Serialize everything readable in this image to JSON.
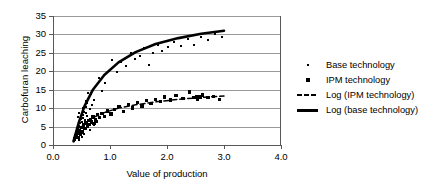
{
  "chart_data": {
    "type": "scatter",
    "title": "",
    "xlabel": "Value of production",
    "ylabel": "Carbofuran leaching",
    "xlim": [
      0.0,
      4.0
    ],
    "ylim": [
      0,
      35
    ],
    "xticks": [
      "0.0",
      "1.0",
      "2.0",
      "3.0",
      "4.0"
    ],
    "xtick_values": [
      0.0,
      1.0,
      2.0,
      3.0,
      4.0
    ],
    "yticks": [
      "0",
      "5",
      "10",
      "15",
      "20",
      "25",
      "30",
      "35"
    ],
    "ytick_values": [
      0,
      5,
      10,
      15,
      20,
      25,
      30,
      35
    ],
    "grid": true,
    "legend_position": "right",
    "series": [
      {
        "name": "Base technology",
        "type": "scatter",
        "marker": "dot",
        "points": [
          [
            0.36,
            1.2
          ],
          [
            0.38,
            2.0
          ],
          [
            0.39,
            2.6
          ],
          [
            0.4,
            3.1
          ],
          [
            0.41,
            1.8
          ],
          [
            0.42,
            3.8
          ],
          [
            0.43,
            4.5
          ],
          [
            0.44,
            2.9
          ],
          [
            0.45,
            5.2
          ],
          [
            0.46,
            4.0
          ],
          [
            0.47,
            6.0
          ],
          [
            0.48,
            5.0
          ],
          [
            0.49,
            7.0
          ],
          [
            0.5,
            6.2
          ],
          [
            0.51,
            3.4
          ],
          [
            0.52,
            8.1
          ],
          [
            0.53,
            7.4
          ],
          [
            0.54,
            5.6
          ],
          [
            0.55,
            9.0
          ],
          [
            0.56,
            6.8
          ],
          [
            0.57,
            10.2
          ],
          [
            0.58,
            8.6
          ],
          [
            0.59,
            11.4
          ],
          [
            0.6,
            7.8
          ],
          [
            0.62,
            12.6
          ],
          [
            0.64,
            9.8
          ],
          [
            0.66,
            13.8
          ],
          [
            0.68,
            11.0
          ],
          [
            0.7,
            15.0
          ],
          [
            0.72,
            12.2
          ],
          [
            0.6,
            5.0
          ],
          [
            0.64,
            4.2
          ],
          [
            0.68,
            6.4
          ],
          [
            0.72,
            5.4
          ],
          [
            0.76,
            7.2
          ],
          [
            0.8,
            18.2
          ],
          [
            0.86,
            14.6
          ],
          [
            0.92,
            16.8
          ],
          [
            0.98,
            20.0
          ],
          [
            1.04,
            23.0
          ],
          [
            1.12,
            19.8
          ],
          [
            1.2,
            22.6
          ],
          [
            1.28,
            21.4
          ],
          [
            1.36,
            25.0
          ],
          [
            1.44,
            23.4
          ],
          [
            1.52,
            24.2
          ],
          [
            1.6,
            26.2
          ],
          [
            1.68,
            21.8
          ],
          [
            1.76,
            25.0
          ],
          [
            1.84,
            27.2
          ],
          [
            1.92,
            25.6
          ],
          [
            2.02,
            26.6
          ],
          [
            2.12,
            28.0
          ],
          [
            2.24,
            27.0
          ],
          [
            2.36,
            28.8
          ],
          [
            2.48,
            27.2
          ],
          [
            2.6,
            29.2
          ],
          [
            2.72,
            28.4
          ],
          [
            2.84,
            30.0
          ],
          [
            2.96,
            29.4
          ],
          [
            0.44,
            7.6
          ],
          [
            0.46,
            8.8
          ],
          [
            0.52,
            10.0
          ],
          [
            0.58,
            12.0
          ],
          [
            0.62,
            14.0
          ],
          [
            0.5,
            2.2
          ],
          [
            0.54,
            3.0
          ],
          [
            0.58,
            4.4
          ],
          [
            0.45,
            1.5
          ],
          [
            0.42,
            2.4
          ]
        ]
      },
      {
        "name": "IPM technology",
        "type": "scatter",
        "marker": "square",
        "points": [
          [
            0.38,
            1.6
          ],
          [
            0.4,
            2.4
          ],
          [
            0.42,
            3.2
          ],
          [
            0.44,
            2.0
          ],
          [
            0.46,
            4.0
          ],
          [
            0.48,
            3.0
          ],
          [
            0.5,
            4.8
          ],
          [
            0.52,
            3.6
          ],
          [
            0.54,
            5.4
          ],
          [
            0.56,
            4.4
          ],
          [
            0.58,
            6.0
          ],
          [
            0.6,
            5.0
          ],
          [
            0.62,
            6.6
          ],
          [
            0.64,
            5.6
          ],
          [
            0.66,
            7.0
          ],
          [
            0.68,
            6.2
          ],
          [
            0.7,
            7.6
          ],
          [
            0.74,
            6.8
          ],
          [
            0.78,
            8.2
          ],
          [
            0.82,
            7.4
          ],
          [
            0.86,
            8.6
          ],
          [
            0.9,
            7.8
          ],
          [
            0.96,
            9.2
          ],
          [
            1.02,
            8.4
          ],
          [
            1.08,
            9.6
          ],
          [
            1.16,
            10.4
          ],
          [
            1.24,
            9.0
          ],
          [
            1.32,
            11.0
          ],
          [
            1.4,
            10.0
          ],
          [
            1.48,
            11.6
          ],
          [
            1.56,
            10.6
          ],
          [
            1.64,
            12.0
          ],
          [
            1.72,
            11.2
          ],
          [
            1.8,
            12.4
          ],
          [
            1.88,
            11.8
          ],
          [
            1.96,
            13.0
          ],
          [
            2.06,
            12.2
          ],
          [
            2.16,
            13.4
          ],
          [
            2.28,
            12.6
          ],
          [
            2.4,
            14.4
          ],
          [
            2.52,
            13.0
          ],
          [
            2.62,
            13.6
          ],
          [
            2.72,
            12.8
          ],
          [
            2.82,
            13.2
          ],
          [
            2.92,
            12.4
          ],
          [
            2.46,
            12.8
          ],
          [
            2.54,
            12.4
          ],
          [
            2.58,
            13.0
          ],
          [
            0.72,
            5.8
          ],
          [
            0.76,
            6.4
          ]
        ]
      }
    ],
    "fits": [
      {
        "name": "Log (base technology)",
        "style": "solid",
        "curve": [
          [
            0.36,
            1.0
          ],
          [
            0.45,
            6.0
          ],
          [
            0.55,
            10.5
          ],
          [
            0.7,
            15.0
          ],
          [
            0.9,
            19.0
          ],
          [
            1.15,
            22.4
          ],
          [
            1.45,
            25.2
          ],
          [
            1.8,
            27.4
          ],
          [
            2.2,
            29.0
          ],
          [
            2.6,
            30.2
          ],
          [
            3.0,
            31.0
          ]
        ]
      },
      {
        "name": "Log (IPM technology)",
        "style": "dashed",
        "curve": [
          [
            0.36,
            1.2
          ],
          [
            0.45,
            4.0
          ],
          [
            0.55,
            5.8
          ],
          [
            0.7,
            7.4
          ],
          [
            0.9,
            8.8
          ],
          [
            1.15,
            10.0
          ],
          [
            1.45,
            10.9
          ],
          [
            1.8,
            11.7
          ],
          [
            2.2,
            12.4
          ],
          [
            2.6,
            12.9
          ],
          [
            3.0,
            13.3
          ]
        ]
      }
    ]
  },
  "legend": {
    "items": [
      {
        "label": "Base technology",
        "mark": "dot-marker"
      },
      {
        "label": "IPM technology",
        "mark": "square-marker"
      },
      {
        "label": "Log (IPM technology)",
        "mark": "dashed-line"
      },
      {
        "label": "Log (base technology)",
        "mark": "solid-line"
      }
    ]
  },
  "colors": {
    "data": "#000000",
    "grid": "#9a9a9c",
    "axis": "#58585a",
    "background": "#ffffff"
  }
}
